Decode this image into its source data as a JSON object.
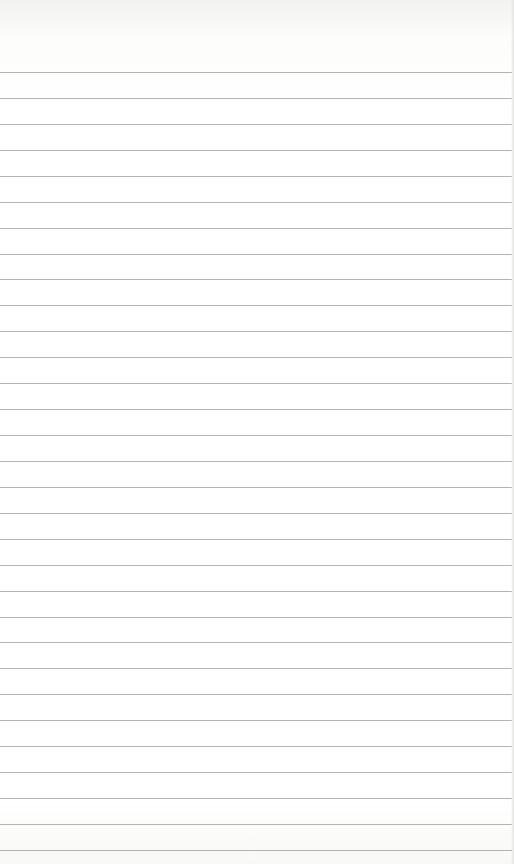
{
  "paper": {
    "background_color": "#ffffff",
    "line_color": "#9b9b9b",
    "first_line_y": 72,
    "line_spacing": 25.93,
    "line_count": 31
  }
}
